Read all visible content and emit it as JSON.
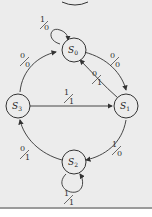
{
  "diagram": {
    "type": "state-machine",
    "states": [
      {
        "id": "S0",
        "name": "S",
        "sub": "0",
        "position": "top"
      },
      {
        "id": "S1",
        "name": "S",
        "sub": "1",
        "position": "right"
      },
      {
        "id": "S2",
        "name": "S",
        "sub": "2",
        "position": "bottom"
      },
      {
        "id": "S3",
        "name": "S",
        "sub": "3",
        "position": "left"
      }
    ],
    "transitions": [
      {
        "from": "S0",
        "to": "S0",
        "input": "1",
        "output": "0"
      },
      {
        "from": "S3",
        "to": "S0",
        "input": "0",
        "output": "0"
      },
      {
        "from": "S0",
        "to": "S1",
        "input": "0",
        "output": "0"
      },
      {
        "from": "S1",
        "to": "S0",
        "input": "0",
        "output": "1"
      },
      {
        "from": "S3",
        "to": "S1",
        "input": "1",
        "output": "1"
      },
      {
        "from": "S1",
        "to": "S2",
        "input": "1",
        "output": "0"
      },
      {
        "from": "S2",
        "to": "S3",
        "input": "0",
        "output": "1"
      },
      {
        "from": "S2",
        "to": "S2",
        "input": "1",
        "output": "1"
      }
    ]
  },
  "colors": {
    "background": "#ececec",
    "stroke": "#333333"
  }
}
